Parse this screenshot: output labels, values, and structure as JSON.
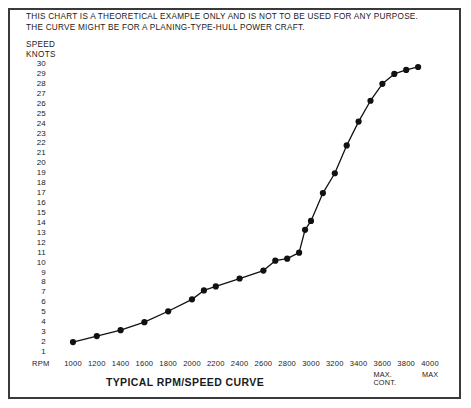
{
  "note": {
    "line1": "THIS CHART IS A THEORETICAL EXAMPLE ONLY AND IS NOT TO BE USED FOR ANY PURPOSE.",
    "line2": "THE CURVE MIGHT BE FOR A PLANING-TYPE-HULL POWER CRAFT."
  },
  "axis_title": {
    "line1": "SPEED",
    "line2": "KNOTS"
  },
  "title": "TYPICAL RPM/SPEED CURVE",
  "x_axis_name": "RPM",
  "markers": {
    "max_cont_line1": "MAX.",
    "max_cont_line2": "CONT.",
    "max": "MAX"
  },
  "colors": {
    "ink": "#1a1a1a",
    "frame": "#3a3a3a",
    "curve": "#111111",
    "background": "#ffffff"
  },
  "chart_data": {
    "type": "line",
    "title": "TYPICAL RPM/SPEED CURVE",
    "xlabel": "RPM",
    "ylabel": "SPEED KNOTS",
    "xlim": [
      1000,
      4000
    ],
    "ylim": [
      1,
      30
    ],
    "grid": false,
    "legend": null,
    "x_ticks": [
      1000,
      1200,
      1400,
      1600,
      1800,
      2000,
      2200,
      2400,
      2600,
      2800,
      3000,
      3200,
      3400,
      3600,
      3800,
      4000
    ],
    "y_ticks": [
      1,
      2,
      3,
      4,
      5,
      6,
      7,
      8,
      9,
      10,
      11,
      12,
      13,
      14,
      15,
      16,
      17,
      18,
      19,
      20,
      21,
      22,
      23,
      24,
      25,
      26,
      27,
      28,
      29,
      30
    ],
    "annotations": [
      {
        "text": "MAX. CONT.",
        "x": 3600
      },
      {
        "text": "MAX",
        "x": 4000
      }
    ],
    "series": [
      {
        "name": "Speed vs RPM",
        "marker": "filled-circle",
        "points": [
          {
            "x": 1000,
            "y": 2.0
          },
          {
            "x": 1200,
            "y": 2.6
          },
          {
            "x": 1400,
            "y": 3.2
          },
          {
            "x": 1600,
            "y": 4.0
          },
          {
            "x": 1800,
            "y": 5.1
          },
          {
            "x": 2000,
            "y": 6.3
          },
          {
            "x": 2100,
            "y": 7.2
          },
          {
            "x": 2200,
            "y": 7.6
          },
          {
            "x": 2400,
            "y": 8.4
          },
          {
            "x": 2600,
            "y": 9.2
          },
          {
            "x": 2700,
            "y": 10.2
          },
          {
            "x": 2800,
            "y": 10.4
          },
          {
            "x": 2900,
            "y": 11.0
          },
          {
            "x": 2950,
            "y": 13.3
          },
          {
            "x": 3000,
            "y": 14.2
          },
          {
            "x": 3100,
            "y": 17.0
          },
          {
            "x": 3200,
            "y": 19.0
          },
          {
            "x": 3300,
            "y": 21.8
          },
          {
            "x": 3400,
            "y": 24.2
          },
          {
            "x": 3500,
            "y": 26.3
          },
          {
            "x": 3600,
            "y": 28.0
          },
          {
            "x": 3700,
            "y": 29.0
          },
          {
            "x": 3800,
            "y": 29.4
          },
          {
            "x": 3900,
            "y": 29.7
          }
        ]
      }
    ]
  }
}
